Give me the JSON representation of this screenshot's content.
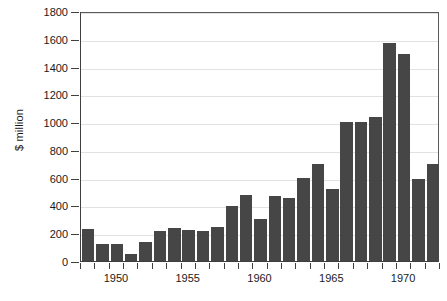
{
  "chart_data": {
    "type": "bar",
    "title": "",
    "subtitle": "",
    "xlabel": "",
    "ylabel": "$ million",
    "ylim": [
      0,
      1800
    ],
    "ytick_values": [
      0,
      200,
      400,
      600,
      800,
      1000,
      1200,
      1400,
      1600,
      1800
    ],
    "ytick_labels": [
      "0",
      "200",
      "400",
      "600",
      "800",
      "1000",
      "1200",
      "1400",
      "1600",
      "1800"
    ],
    "xtick_labels": [
      "1950",
      "1955",
      "1960",
      "1965",
      "1970"
    ],
    "xtick_values": [
      1950,
      1955,
      1960,
      1965,
      1970
    ],
    "grid": true,
    "grid_axis": "y",
    "legend": false,
    "legend_position": "none",
    "bar_color": "#464646",
    "categories": [
      "1948",
      "1949",
      "1950",
      "1951",
      "1952",
      "1953",
      "1954",
      "1955",
      "1956",
      "1957",
      "1958",
      "1959",
      "1960",
      "1961",
      "1962",
      "1963",
      "1964",
      "1965",
      "1966",
      "1967",
      "1968",
      "1969",
      "1970",
      "1971",
      "1972"
    ],
    "values": [
      230,
      120,
      125,
      50,
      140,
      215,
      235,
      220,
      215,
      245,
      395,
      475,
      300,
      465,
      455,
      600,
      695,
      520,
      1000,
      1000,
      1035,
      1570,
      1490,
      590,
      695
    ],
    "series": [
      {
        "name": "$ million",
        "values": [
          230,
          120,
          125,
          50,
          140,
          215,
          235,
          220,
          215,
          245,
          395,
          475,
          300,
          465,
          455,
          600,
          695,
          520,
          1000,
          1000,
          1035,
          1570,
          1490,
          590,
          695
        ]
      }
    ]
  },
  "colors": {
    "bar": "#464646",
    "grid": "#e2e2e2",
    "axis": "#404040",
    "text": "#1a1a1a",
    "background": "#ffffff"
  }
}
